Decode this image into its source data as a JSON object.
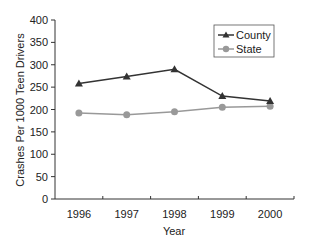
{
  "chart_data": {
    "type": "line",
    "title": "",
    "xlabel": "Year",
    "ylabel": "Crashes Per 1000 Teen Drivers",
    "categories": [
      "1996",
      "1997",
      "1998",
      "1999",
      "2000"
    ],
    "series": [
      {
        "name": "County",
        "marker": "triangle",
        "color": "#333333",
        "values": [
          258,
          274,
          290,
          230,
          219
        ]
      },
      {
        "name": "State",
        "marker": "circle",
        "color": "#999999",
        "values": [
          192,
          188,
          195,
          205,
          207
        ]
      }
    ],
    "ylim": [
      0,
      400
    ],
    "yticks": [
      "0",
      "50",
      "100",
      "150",
      "200",
      "250",
      "300",
      "350",
      "400"
    ],
    "grid": false,
    "legend_position": "upper right, boxed"
  }
}
